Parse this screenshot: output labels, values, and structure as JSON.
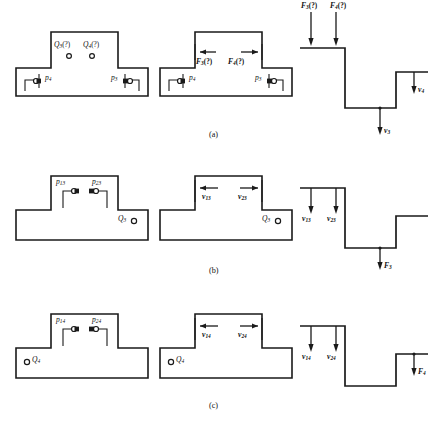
{
  "figure": {
    "captions": {
      "a": "(a)",
      "b": "(b)",
      "c": "(c)"
    }
  },
  "rows": [
    {
      "id": "a",
      "caption": "(a)",
      "left_panel": {
        "name": "block-with-flow-unknowns",
        "top_labels": [
          {
            "base": "Q",
            "sub": "3",
            "paren": "(?)"
          },
          {
            "base": "Q",
            "sub": "4",
            "paren": "(?)"
          }
        ],
        "port_labels": [
          {
            "base": "p",
            "sub": "4"
          },
          {
            "base": "p",
            "sub": "3"
          }
        ]
      },
      "mid_panel": {
        "name": "block-with-force-unknowns",
        "arrow_labels": [
          {
            "base": "F",
            "sub": "3",
            "paren": "(?)"
          },
          {
            "base": "F",
            "sub": "4",
            "paren": "(?)"
          }
        ],
        "port_labels": [
          {
            "base": "p",
            "sub": "4"
          },
          {
            "base": "p",
            "sub": "3"
          }
        ]
      },
      "right_panel": {
        "name": "step-profile-force-unknowns",
        "top_labels": [
          {
            "base": "F",
            "sub": "3",
            "paren": "(?)"
          },
          {
            "base": "F",
            "sub": "4",
            "paren": "(?)"
          }
        ],
        "down_labels": [
          {
            "base": "v",
            "sub": "3"
          },
          {
            "base": "v",
            "sub": "4"
          }
        ]
      }
    },
    {
      "id": "b",
      "caption": "(b)",
      "left_panel": {
        "name": "block-pressure-case-3",
        "top_labels": [
          {
            "base": "p",
            "sub": "13"
          },
          {
            "base": "p",
            "sub": "23"
          }
        ],
        "flow_label": {
          "base": "Q",
          "sub": "3"
        }
      },
      "mid_panel": {
        "name": "block-velocity-case-3",
        "arrow_labels": [
          {
            "base": "v",
            "sub": "13"
          },
          {
            "base": "v",
            "sub": "23"
          }
        ],
        "flow_label": {
          "base": "Q",
          "sub": "3"
        }
      },
      "right_panel": {
        "name": "step-profile-case-3",
        "down_labels": [
          {
            "base": "v",
            "sub": "13"
          },
          {
            "base": "v",
            "sub": "23"
          }
        ],
        "force_label": {
          "base": "F",
          "sub": "3"
        }
      }
    },
    {
      "id": "c",
      "caption": "(c)",
      "left_panel": {
        "name": "block-pressure-case-4",
        "top_labels": [
          {
            "base": "p",
            "sub": "14"
          },
          {
            "base": "p",
            "sub": "24"
          }
        ],
        "flow_label": {
          "base": "Q",
          "sub": "4"
        }
      },
      "mid_panel": {
        "name": "block-velocity-case-4",
        "arrow_labels": [
          {
            "base": "v",
            "sub": "14"
          },
          {
            "base": "v",
            "sub": "24"
          }
        ],
        "flow_label": {
          "base": "Q",
          "sub": "4"
        }
      },
      "right_panel": {
        "name": "step-profile-case-4",
        "down_labels": [
          {
            "base": "v",
            "sub": "14"
          },
          {
            "base": "v",
            "sub": "24"
          }
        ],
        "force_label": {
          "base": "F",
          "sub": "4"
        }
      }
    }
  ],
  "colors": {
    "ink": "#1a1a1a",
    "paper": "#ffffff"
  }
}
